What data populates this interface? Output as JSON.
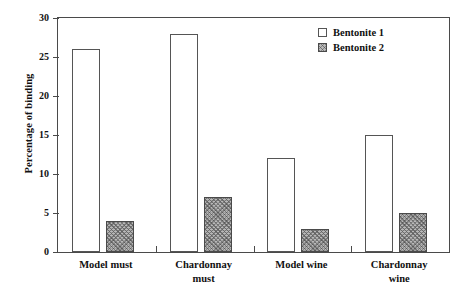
{
  "chart_data": {
    "type": "bar",
    "title": "",
    "xlabel": "",
    "ylabel": "Percentage of binding",
    "categories": [
      "Model must",
      "Chardonnay must",
      "Model wine",
      "Chardonnay wine"
    ],
    "category_lines": [
      [
        "Model must"
      ],
      [
        "Chardonnay",
        "must"
      ],
      [
        "Model wine"
      ],
      [
        "Chardonnay",
        "wine"
      ]
    ],
    "series": [
      {
        "name": "Bentonite 1",
        "values": [
          26,
          28,
          12,
          15
        ],
        "style": "open"
      },
      {
        "name": "Bentonite 2",
        "values": [
          4,
          7,
          3,
          5
        ],
        "style": "stippled"
      }
    ],
    "ylim": [
      0,
      30
    ],
    "yticks": [
      0,
      5,
      10,
      15,
      20,
      25,
      30
    ],
    "ytick_labels": [
      "0",
      "5",
      "10",
      "15",
      "20",
      "25",
      "30"
    ],
    "grid": false,
    "legend_position": "top-right",
    "colors": {
      "axis": "#4a4a4a",
      "bar_open_fill": "#ffffff",
      "bar_open_edge": "#555555",
      "bar_stippled_fill": "#b9b9b9",
      "bar_stippled_edge": "#4a4a4a",
      "text": "#111111",
      "background": "#ffffff"
    }
  },
  "legend": {
    "items": [
      {
        "label": "Bentonite 1",
        "swatch": "open-square-icon"
      },
      {
        "label": "Bentonite 2",
        "swatch": "stippled-square-icon"
      }
    ]
  }
}
